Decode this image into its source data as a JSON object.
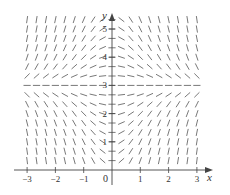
{
  "chart_data": {
    "type": "slope_field",
    "equation_inferred": "dy/dx = x(3 - y)",
    "title": "",
    "xlabel": "x",
    "ylabel": "y",
    "origin_label": "0",
    "xlim": [
      -3,
      3
    ],
    "ylim": [
      0,
      5.33
    ],
    "x_ticks": [
      -3,
      -2,
      -1,
      1,
      2,
      3
    ],
    "x_tick_labels": [
      "−3",
      "−2",
      "−1",
      "1",
      "2",
      "3"
    ],
    "y_ticks": [
      1,
      2,
      3,
      4,
      5
    ],
    "y_tick_labels": [
      "1",
      "2",
      "3",
      "4",
      "5"
    ],
    "grid": false,
    "segment_grid": {
      "x_start": -3,
      "x_end": 3,
      "x_step": 0.3333,
      "y_start": 0.3333,
      "y_end": 5.3333,
      "y_step": 0.3333
    },
    "equilibrium_line_y": 3,
    "colors": {
      "segments": "#555555",
      "axes": "#444444",
      "text": "#333333",
      "background": "#ffffff"
    }
  }
}
